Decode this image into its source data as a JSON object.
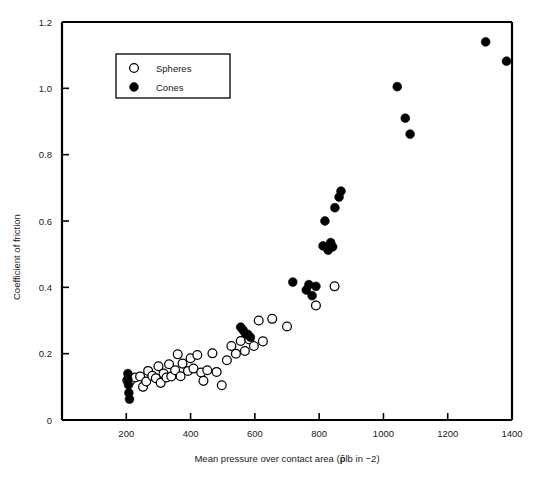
{
  "chart_data": {
    "type": "scatter",
    "title": "",
    "xlabel": "Mean pressure over contact area (p̄ lb in −2)",
    "xlabel_prefix": "Mean pressure over contact area (",
    "xlabel_symbol": "p̄",
    "xlabel_suffix": "lb in −2)",
    "ylabel": "Coefficient of friction",
    "xlim": [
      0,
      1400
    ],
    "ylim": [
      0,
      1.2
    ],
    "xticks": [
      200,
      400,
      600,
      800,
      1000,
      1200,
      1400
    ],
    "xticklabels": [
      "200",
      "400",
      "600",
      "800",
      "1000",
      "1200",
      "1400"
    ],
    "yticks": [
      0,
      0.2,
      0.4,
      0.6,
      0.8,
      1.0,
      1.2
    ],
    "yticklabels": [
      "0",
      "0.2",
      "0.4",
      "0.6",
      "0.8",
      "1.0",
      "1.2"
    ],
    "grid": false,
    "legend_position": "upper-left-inset",
    "series": [
      {
        "name": "Spheres",
        "marker": "open-circle",
        "color": "#000000",
        "fill": "#ffffff",
        "points": [
          [
            203,
            0.12
          ],
          [
            212,
            0.118
          ],
          [
            228,
            0.128
          ],
          [
            243,
            0.131
          ],
          [
            252,
            0.1
          ],
          [
            262,
            0.116
          ],
          [
            268,
            0.148
          ],
          [
            281,
            0.133
          ],
          [
            292,
            0.126
          ],
          [
            300,
            0.162
          ],
          [
            307,
            0.112
          ],
          [
            316,
            0.14
          ],
          [
            325,
            0.128
          ],
          [
            333,
            0.168
          ],
          [
            340,
            0.131
          ],
          [
            352,
            0.15
          ],
          [
            360,
            0.198
          ],
          [
            369,
            0.132
          ],
          [
            375,
            0.17
          ],
          [
            392,
            0.148
          ],
          [
            400,
            0.186
          ],
          [
            409,
            0.155
          ],
          [
            421,
            0.196
          ],
          [
            433,
            0.143
          ],
          [
            440,
            0.118
          ],
          [
            452,
            0.15
          ],
          [
            468,
            0.201
          ],
          [
            481,
            0.145
          ],
          [
            497,
            0.105
          ],
          [
            513,
            0.18
          ],
          [
            527,
            0.223
          ],
          [
            541,
            0.2
          ],
          [
            556,
            0.238
          ],
          [
            569,
            0.208
          ],
          [
            583,
            0.243
          ],
          [
            597,
            0.223
          ],
          [
            612,
            0.3
          ],
          [
            625,
            0.237
          ],
          [
            654,
            0.305
          ],
          [
            700,
            0.282
          ],
          [
            790,
            0.345
          ],
          [
            848,
            0.403
          ]
        ]
      },
      {
        "name": "Cones",
        "marker": "filled-circle",
        "color": "#000000",
        "fill": "#000000",
        "points": [
          [
            205,
            0.14
          ],
          [
            205,
            0.122
          ],
          [
            207,
            0.106
          ],
          [
            208,
            0.082
          ],
          [
            210,
            0.063
          ],
          [
            556,
            0.28
          ],
          [
            563,
            0.272
          ],
          [
            570,
            0.262
          ],
          [
            578,
            0.258
          ],
          [
            586,
            0.25
          ],
          [
            718,
            0.416
          ],
          [
            760,
            0.392
          ],
          [
            768,
            0.408
          ],
          [
            778,
            0.375
          ],
          [
            790,
            0.403
          ],
          [
            812,
            0.525
          ],
          [
            818,
            0.6
          ],
          [
            828,
            0.512
          ],
          [
            836,
            0.535
          ],
          [
            842,
            0.522
          ],
          [
            849,
            0.64
          ],
          [
            862,
            0.672
          ],
          [
            868,
            0.69
          ],
          [
            1043,
            1.005
          ],
          [
            1068,
            0.91
          ],
          [
            1083,
            0.862
          ],
          [
            1318,
            1.14
          ],
          [
            1383,
            1.082
          ]
        ]
      }
    ]
  },
  "legend": {
    "items": [
      {
        "label": "Spheres",
        "marker": "open-circle"
      },
      {
        "label": "Cones",
        "marker": "filled-circle"
      }
    ]
  }
}
